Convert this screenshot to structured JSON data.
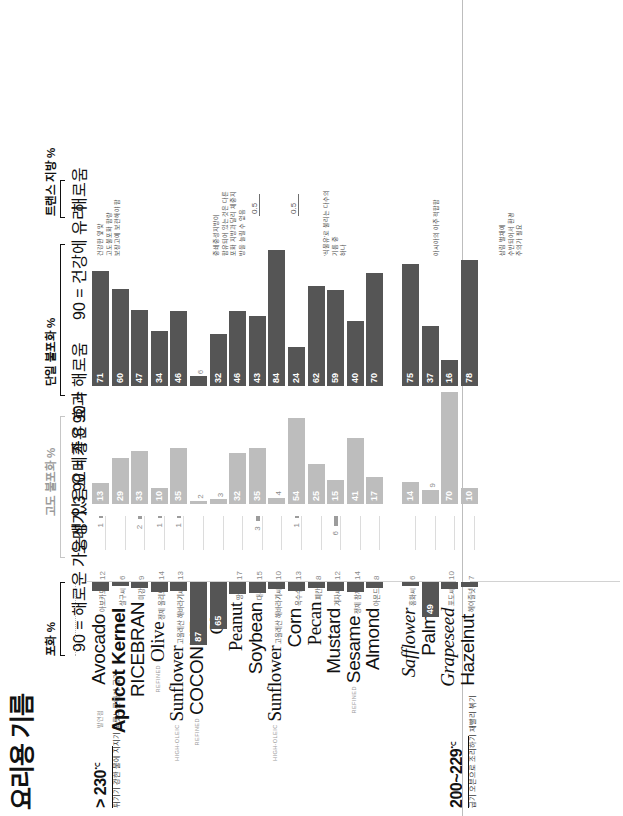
{
  "headline": "요리용 기름",
  "axes": {
    "saturated": {
      "label": "포화 %",
      "sub": "90 = 해로운 가능성 있음"
    },
    "poly3": {
      "label": "고도 불포화 %",
      "sub": "오메가 3\n90 = 좋은 효과"
    },
    "poly6": {
      "label": "",
      "sub": "오메가 6\n90 = 해로움"
    },
    "mono": {
      "label": "단일 불포화 %",
      "sub": "90 = 건강에 유리"
    },
    "trans": {
      "label": "트랜스 지방 %",
      "sub": "해로움"
    }
  },
  "groups": [
    {
      "id": "g1",
      "temp": "> 230",
      "deg": "℃",
      "label": "발연점",
      "uses": "튀기기\n강한 불에 지지기\n노릇노릇하게 굽기"
    },
    {
      "id": "g2",
      "temp": "200~229",
      "deg": "℃",
      "label": "",
      "uses": "굽기\n오븐으로 조리하기\n재빨리 볶기"
    }
  ],
  "columns": [
    "포화 %",
    "고도 불포화 % (오메가3)",
    "고도 불포화 % (오메가6)",
    "단일 불포화 %",
    "트랜스 지방 %"
  ],
  "notes": [
    {
      "id": "note-avocado",
      "text": "건강한 옆 맞\n고도불포화 함량\n보장고에 보관해야 함"
    },
    {
      "id": "note-coconut",
      "text": "중쇄중성지방이\n함유되어 있는 것은 다른\n포화 지방과 달리 체중지\n방을 늘릴 수 없음"
    },
    {
      "id": "note-corn",
      "text": "'식물유'로 불리는 다수의\n기름 중\n하나"
    },
    {
      "id": "note-sesame",
      "text": "아시아의 아주 적합함"
    },
    {
      "id": "note-palm",
      "text": "삼림 벌채에\n수반되어서 환경\n주의가 필요"
    }
  ],
  "trans_markers": [
    {
      "oil": "Soybean",
      "value": "0.5"
    },
    {
      "oil": "Corn",
      "value": "0.5"
    }
  ],
  "chart_data": {
    "type": "bar",
    "title": "요리용 기름",
    "xlabel": "",
    "ylabel": "",
    "series": [
      "포화 %",
      "오메가 3 %",
      "오메가 6 %",
      "단일 불포화 %",
      "트랜스 지방 %"
    ],
    "categories": [
      "Avocado",
      "Apricot Kernel",
      "RICEBRAN",
      "Olive",
      "Sunflower",
      "COCONUT",
      "Ghee",
      "Peanut",
      "Soybean",
      "Sunflower",
      "Corn",
      "Pecan",
      "Mustard",
      "Sesame",
      "Almond",
      "Safflower",
      "Palm",
      "Grapeseed",
      "Hazelnut"
    ],
    "rows": [
      {
        "name": "Avocado",
        "prefix": "",
        "ko": "아보카도",
        "style": "thin",
        "sat": 12,
        "p3": 1,
        "p6": 13,
        "mono": 71,
        "trans": null
      },
      {
        "name": "Apricot Kernel",
        "prefix": "",
        "ko": "살구씨",
        "style": "bold",
        "sat": 6,
        "p3": 0,
        "p6": 29,
        "mono": 60,
        "trans": null
      },
      {
        "name": "RICEBRAN",
        "prefix": "",
        "ko": "미강",
        "style": "thin",
        "sat": 9,
        "p3": 2,
        "p6": 33,
        "mono": 47,
        "trans": null
      },
      {
        "name": "Olive",
        "prefix": "REFINED",
        "ko": "정제 올리브",
        "style": "serif",
        "sat": 14,
        "p3": 1,
        "p6": 10,
        "mono": 34,
        "trans": null
      },
      {
        "name": "Sunflower",
        "prefix": "HIGH-OLEIC",
        "ko": "고올레산 해바라기씨",
        "style": "serif",
        "sat": 13,
        "p3": 1,
        "p6": 35,
        "mono": 46,
        "trans": null
      },
      {
        "name": "COCONUT",
        "prefix": "REFINED",
        "ko": "정제 코코넛",
        "style": "thin",
        "sat": 87,
        "p3": 0,
        "p6": 2,
        "mono": 6,
        "trans": null
      },
      {
        "name": "Ghee",
        "prefix": "",
        "ko": "기",
        "style": "serif",
        "sat": 65,
        "p3": 0,
        "p6": 3,
        "mono": 32,
        "trans": null
      },
      {
        "name": "Peanut",
        "prefix": "",
        "ko": "땅콩",
        "style": "serif",
        "sat": 17,
        "p3": 0,
        "p6": 32,
        "mono": 46,
        "trans": null
      },
      {
        "name": "Soybean",
        "prefix": "",
        "ko": "대두",
        "style": "thin",
        "sat": 15,
        "p3": 3,
        "p6": 35,
        "mono": 43,
        "trans": 0.5
      },
      {
        "name": "Sunflower",
        "prefix": "HIGH-OLEIC",
        "ko": "고올레산 해바라기씨",
        "style": "serif",
        "sat": 10,
        "p3": 0,
        "p6": 4,
        "mono": 84,
        "trans": null
      },
      {
        "name": "Corn",
        "prefix": "",
        "ko": "옥수수",
        "style": "thin",
        "sat": 13,
        "p3": 1,
        "p6": 54,
        "mono": 24,
        "trans": 0.5
      },
      {
        "name": "Pecan",
        "prefix": "",
        "ko": "피칸",
        "style": "serif",
        "sat": 8,
        "p3": 0,
        "p6": 25,
        "mono": 62,
        "trans": null
      },
      {
        "name": "Mustard",
        "prefix": "",
        "ko": "겨자씨",
        "style": "thin",
        "sat": 12,
        "p3": 6,
        "p6": 15,
        "mono": 59,
        "trans": null
      },
      {
        "name": "Sesame",
        "prefix": "REFINED",
        "ko": "정제 참깨",
        "style": "thin",
        "sat": 14,
        "p3": 0,
        "p6": 41,
        "mono": 40,
        "trans": null
      },
      {
        "name": "Almond",
        "prefix": "",
        "ko": "아몬드",
        "style": "thin",
        "sat": 8,
        "p3": 0,
        "p6": 17,
        "mono": 70,
        "trans": null
      },
      {
        "name": "Safflower",
        "prefix": "",
        "ko": "홍화씨",
        "style": "ital",
        "sat": 6,
        "p3": 0,
        "p6": 14,
        "mono": 75,
        "trans": null
      },
      {
        "name": "Palm",
        "prefix": "",
        "ko": "야자열매",
        "style": "thin",
        "sat": 49,
        "p3": 0,
        "p6": 9,
        "mono": 37,
        "trans": null
      },
      {
        "name": "Grapeseed",
        "prefix": "",
        "ko": "포도씨",
        "style": "ital",
        "sat": 10,
        "p3": 0,
        "p6": 70,
        "mono": 16,
        "trans": null
      },
      {
        "name": "Hazelnut",
        "prefix": "",
        "ko": "헤이즐넛",
        "style": "thin",
        "sat": 7,
        "p3": 0,
        "p6": 10,
        "mono": 78,
        "trans": null
      }
    ],
    "group_split_after": 15
  }
}
